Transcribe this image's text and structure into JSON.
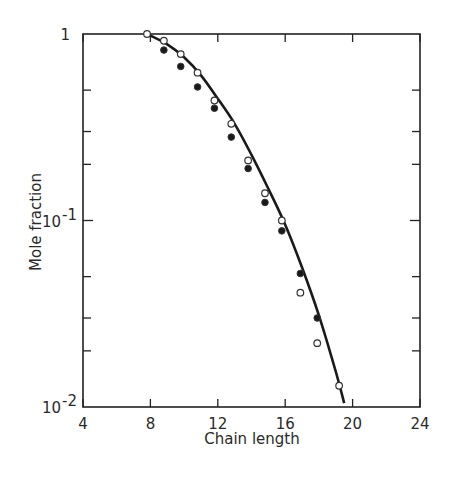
{
  "chart_data": {
    "type": "scatter",
    "title": "",
    "xlabel": "Chain length",
    "ylabel": "Mole fraction",
    "xlim": [
      4,
      24
    ],
    "ylim": [
      0.01,
      1
    ],
    "yscale": "log",
    "grid": false,
    "legend": null,
    "x_ticks": [
      4,
      8,
      12,
      16,
      20,
      24
    ],
    "x_tick_labels": [
      "4",
      "8",
      "12",
      "16",
      "20",
      "24"
    ],
    "y_tick_labels": [
      {
        "value": 1,
        "label": "1"
      },
      {
        "value": 0.1,
        "label": "10",
        "exp": "-1"
      },
      {
        "value": 0.01,
        "label": "10",
        "exp": "-2"
      }
    ],
    "series": [
      {
        "name": "open circles",
        "marker": "open-circle",
        "x": [
          7.8,
          8.8,
          9.8,
          10.8,
          11.8,
          12.8,
          13.8,
          14.8,
          15.8,
          16.9,
          17.9,
          19.2
        ],
        "y": [
          1.0,
          0.92,
          0.78,
          0.62,
          0.44,
          0.33,
          0.21,
          0.14,
          0.1,
          0.041,
          0.022,
          0.013
        ]
      },
      {
        "name": "filled circles",
        "marker": "filled-circle",
        "x": [
          8.8,
          9.8,
          10.8,
          11.8,
          12.8,
          13.8,
          14.8,
          15.8,
          16.9,
          17.9
        ],
        "y": [
          0.82,
          0.67,
          0.52,
          0.4,
          0.28,
          0.19,
          0.125,
          0.088,
          0.052,
          0.03
        ]
      },
      {
        "name": "fitted curve",
        "marker": "line",
        "x": [
          7.8,
          9,
          10,
          11,
          12,
          13,
          14,
          15,
          16,
          17,
          18,
          19,
          19.5
        ],
        "y": [
          1.0,
          0.88,
          0.75,
          0.6,
          0.45,
          0.33,
          0.225,
          0.148,
          0.095,
          0.056,
          0.031,
          0.0155,
          0.0105
        ]
      }
    ]
  }
}
